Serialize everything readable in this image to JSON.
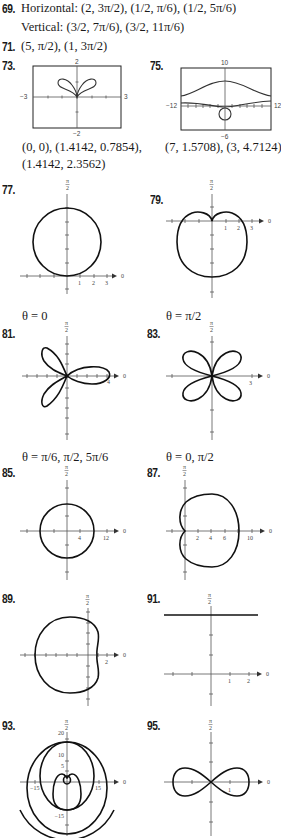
{
  "answers": {
    "a69": {
      "number": "69.",
      "horizontal_label": "Horizontal:",
      "horizontal_points": [
        "(2, 3π/2)",
        "(1/2, π/6)",
        "(1/2, 5π/6)"
      ],
      "vertical_label": "Vertical:",
      "vertical_points": [
        "(3/2, 7π/6)",
        "(3/2, 11π/6)"
      ]
    },
    "a71": {
      "number": "71.",
      "text": "(5, π/2), (1, 3π/2)"
    },
    "a73": {
      "number": "73.",
      "window": {
        "xmin": "−3",
        "xmax": "3",
        "ymin": "−2",
        "ymax": "2"
      },
      "caption_line1": "(0, 0), (1.4142, 0.7854),",
      "caption_line2": "(1.4142, 2.3562)"
    },
    "a75": {
      "number": "75.",
      "window": {
        "xmin": "−12",
        "xmax": "12",
        "ymin": "−6",
        "ymax": "10"
      },
      "caption": "(7, 1.5708), (3, 4.7124)"
    },
    "a77": {
      "number": "77.",
      "ticks": [
        "1",
        "2",
        "3"
      ],
      "caption": "θ = 0"
    },
    "a79": {
      "number": "79.",
      "ticks": [
        "1",
        "2",
        "3"
      ],
      "caption": "θ = π/2"
    },
    "a81": {
      "number": "81.",
      "ticks": [
        "4"
      ],
      "caption": "θ = π/6, π/2, 5π/6"
    },
    "a83": {
      "number": "83.",
      "ticks": [
        "3"
      ],
      "caption": "θ = 0, π/2"
    },
    "a85": {
      "number": "85.",
      "ticks": [
        "4",
        "12"
      ]
    },
    "a87": {
      "number": "87.",
      "ticks": [
        "2",
        "4",
        "6",
        "10"
      ]
    },
    "a89": {
      "number": "89.",
      "ticks": [
        "2"
      ]
    },
    "a91": {
      "number": "91.",
      "ticks": [
        "1",
        "2"
      ]
    },
    "a93": {
      "number": "93.",
      "ticks_x": [
        "−15",
        "15"
      ],
      "ticks_y": [
        "20",
        "10",
        "5",
        "−15"
      ]
    },
    "a95": {
      "number": "95.",
      "ticks": [
        "1"
      ]
    }
  },
  "axis_labels": {
    "polar_axis": "0",
    "pi_over_2_num": "π",
    "pi_over_2_den": "2"
  }
}
